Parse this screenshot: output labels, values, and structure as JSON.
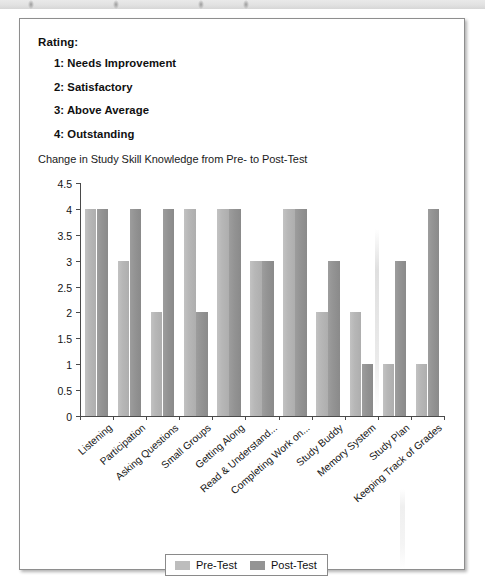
{
  "card": {
    "rating_heading": "Rating:",
    "rating_scale": [
      "1: Needs Improvement",
      "2: Satisfactory",
      "3: Above Average",
      "4: Outstanding"
    ]
  },
  "legend": {
    "pre_label": "Pre-Test",
    "post_label": "Post-Test",
    "pre_color": "#bdbdbd",
    "post_color": "#949494"
  },
  "chart_data": {
    "type": "bar",
    "title": "Change in Study Skill Knowledge from Pre- to Post-Test",
    "xlabel": "",
    "ylabel": "",
    "ylim": [
      0,
      4.5
    ],
    "yticks": [
      "0",
      "0.5",
      "1",
      "1.5",
      "2",
      "2.5",
      "3",
      "3.5",
      "4",
      "4.5"
    ],
    "grid": false,
    "legend_position": "bottom",
    "categories": [
      "Listening",
      "Participation",
      "Asking Questions",
      "Small Groups",
      "Getting Along",
      "Read & Understand...",
      "Completing Work on...",
      "Study Buddy",
      "Memory System",
      "Study Plan",
      "Keeping Track of Grades"
    ],
    "series": [
      {
        "name": "Pre-Test",
        "values": [
          4,
          3,
          2,
          4,
          4,
          3,
          4,
          2,
          2,
          1,
          1
        ]
      },
      {
        "name": "Post-Test",
        "values": [
          4,
          4,
          4,
          2,
          4,
          3,
          4,
          3,
          1,
          3,
          4
        ]
      }
    ]
  }
}
